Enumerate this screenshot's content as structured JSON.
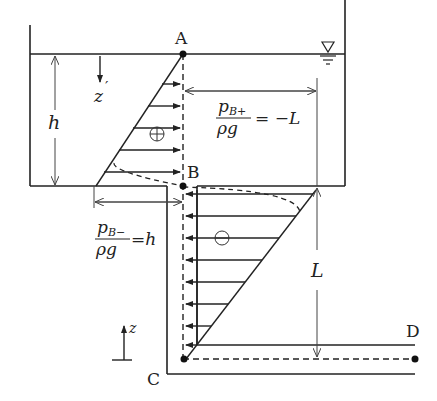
{
  "diagram": {
    "points": {
      "A": "A",
      "B": "B",
      "C": "C",
      "D": "D"
    },
    "labels": {
      "depth": "h",
      "z_prime": "z",
      "z_prime_mark": "′",
      "z_axis": "z",
      "length": "L",
      "plus_sign": "+",
      "minus_sign": "−"
    },
    "equations": {
      "pb_plus": {
        "numerator": "p",
        "subscript": "B+",
        "denominator": "ρg",
        "rhs": "= −L"
      },
      "pb_minus": {
        "numerator": "p",
        "subscript": "B−",
        "denominator": "ρg",
        "rhs": "=h"
      }
    },
    "colors": {
      "line": "#222222",
      "background": "#ffffff"
    }
  }
}
